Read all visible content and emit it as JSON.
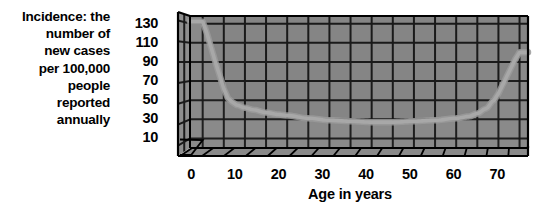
{
  "chart_data": {
    "type": "area",
    "title": "",
    "subtitle": "",
    "ylabel_lines": [
      "Incidence: the",
      "number of",
      "new cases",
      "per 100,000",
      "people",
      "reported",
      "annually"
    ],
    "ylabel": "Incidence: the number of new cases per 100,000 people reported annually",
    "xlabel": "Age in years",
    "y_ticks": [
      130,
      110,
      90,
      70,
      50,
      30,
      10
    ],
    "x_ticks": [
      0,
      10,
      20,
      30,
      40,
      50,
      60,
      70
    ],
    "xlim": [
      -3,
      77
    ],
    "ylim": [
      0,
      138
    ],
    "grid": true,
    "legend": null,
    "style": "3d-perspective-wall",
    "x": [
      0,
      1,
      2,
      3,
      4,
      5,
      6,
      7,
      8,
      10,
      12,
      15,
      18,
      20,
      25,
      30,
      35,
      40,
      45,
      50,
      55,
      60,
      63,
      65,
      67,
      69,
      70,
      71,
      72,
      73,
      74,
      75
    ],
    "values": [
      132,
      120,
      105,
      90,
      76,
      62,
      52,
      48,
      45,
      42,
      40,
      37,
      35,
      34,
      31,
      29,
      28,
      27,
      27,
      28,
      29,
      31,
      33,
      36,
      41,
      50,
      57,
      66,
      75,
      84,
      93,
      100
    ],
    "series": [
      {
        "name": "Incidence",
        "values": [
          132,
          120,
          105,
          90,
          76,
          62,
          52,
          48,
          45,
          42,
          40,
          37,
          35,
          34,
          31,
          29,
          28,
          27,
          27,
          28,
          29,
          31,
          33,
          36,
          41,
          50,
          57,
          66,
          75,
          84,
          93,
          100
        ]
      }
    ]
  },
  "colors": {
    "background": "#ffffff",
    "wall_fill": "#858585",
    "wall_fill_light": "#8e8e8e",
    "foreground_fill": "#8a8a8a",
    "gridline": "#1a1a1a",
    "curve": "#a8a8a8",
    "curve_shadow": "#9a9a9a",
    "outline": "#000000",
    "floor_fill": "#8a8a8a",
    "text": "#000000"
  }
}
